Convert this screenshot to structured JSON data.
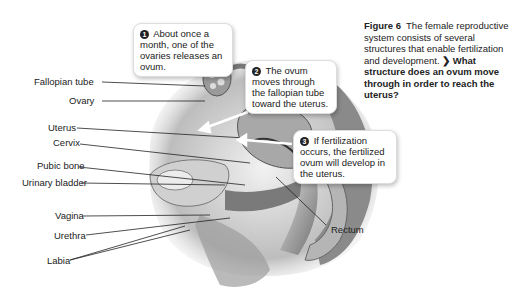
{
  "figure": {
    "number_label": "Figure 6",
    "caption": "The female reproductive system consists of several structures that enable fertilization and development.",
    "question_icon": "chevron-right-icon",
    "question": "What structure does an ovum move through in order to reach the uterus?"
  },
  "callouts": [
    {
      "number": "1",
      "text": "About once a month, one of the ovaries releases an ovum."
    },
    {
      "number": "2",
      "text": "The ovum moves through the fallopian tube toward the uterus."
    },
    {
      "number": "3",
      "text": "If fertilization occurs, the fertilized ovum will develop in the uterus."
    }
  ],
  "labels": {
    "fallopian_tube": "Fallopian tube",
    "ovary": "Ovary",
    "uterus": "Uterus",
    "cervix": "Cervix",
    "pubic_bone": "Pubic bone",
    "urinary_bladder": "Urinary bladder",
    "vagina": "Vagina",
    "urethra": "Urethra",
    "labia": "Labia",
    "rectum": "Rectum"
  }
}
